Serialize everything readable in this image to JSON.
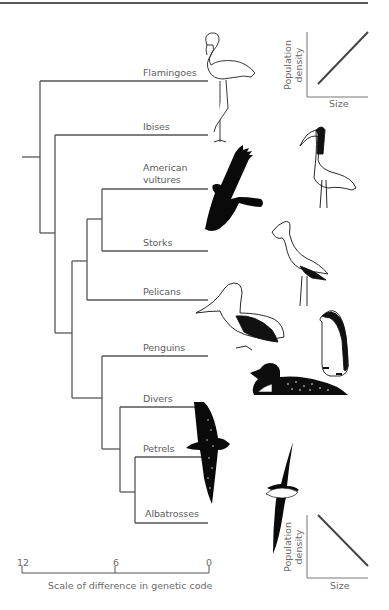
{
  "figure": {
    "taxa": [
      {
        "name": "Flamingoes",
        "label": "Flamingoes"
      },
      {
        "name": "Ibises",
        "label": "Ibises"
      },
      {
        "name": "American vultures",
        "label_line1": "American",
        "label_line2": "vultures"
      },
      {
        "name": "Storks",
        "label": "Storks"
      },
      {
        "name": "Pelicans",
        "label": "Pelicans"
      },
      {
        "name": "Penguins",
        "label": "Penguins"
      },
      {
        "name": "Divers",
        "label": "Divers"
      },
      {
        "name": "Petrels",
        "label": "Petrels"
      },
      {
        "name": "Albatrosses",
        "label": "Albatrosses"
      }
    ],
    "scale_bar": {
      "ticks": [
        "12",
        "6",
        "0"
      ],
      "caption": "Scale of difference in genetic code"
    },
    "inset_top": {
      "ylabel_line1": "Population",
      "ylabel_line2": "density",
      "xlabel": "Size",
      "trend": "positive"
    },
    "inset_bottom": {
      "ylabel_line1": "Population",
      "ylabel_line2": "density",
      "xlabel": "Size",
      "trend": "negative"
    },
    "illustrations": [
      "flamingo-icon",
      "ibis-icon",
      "vulture-icon",
      "stork-icon",
      "pelican-icon",
      "penguin-icon",
      "diver-icon",
      "petrel-icon",
      "albatross-icon"
    ],
    "colors": {
      "line": "#555555",
      "text": "#5e5e5e",
      "ink": "#111111"
    }
  }
}
